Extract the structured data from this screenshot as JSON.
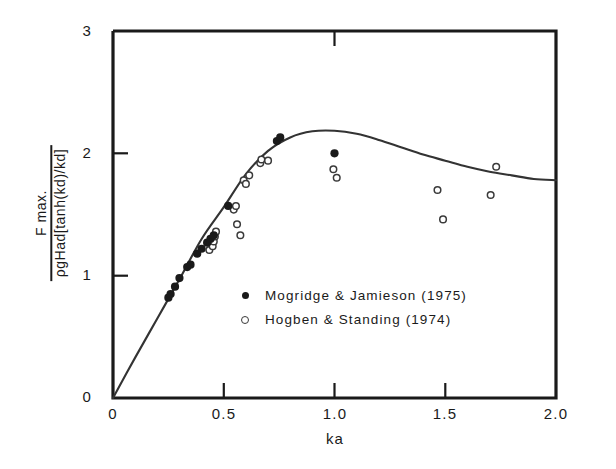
{
  "chart_data": {
    "type": "line",
    "title": "",
    "subtitle": "",
    "xlabel": "ka",
    "ylabel_numerator": "F max.",
    "ylabel_denominator": "ρgHad[tanh(kd)/kd]",
    "xlim": [
      0,
      2.0
    ],
    "ylim": [
      0,
      3
    ],
    "grid": false,
    "x_ticks": [
      0,
      0.5,
      1.0,
      1.5,
      2.0
    ],
    "x_tick_labels": [
      "0",
      "0.5",
      "1.0",
      "1.5",
      "2.0"
    ],
    "y_ticks": [
      0,
      1,
      2,
      3
    ],
    "y_tick_labels": [
      "0",
      "1",
      "2",
      "3"
    ],
    "legend_position": "inside-center",
    "series": [
      {
        "name": "theory-curve",
        "type": "line",
        "marker": "none",
        "color": "#333333",
        "x": [
          0.0,
          0.1,
          0.2,
          0.3,
          0.4,
          0.5,
          0.6,
          0.7,
          0.8,
          0.9,
          1.0,
          1.1,
          1.2,
          1.3,
          1.4,
          1.5,
          1.6,
          1.7,
          1.8,
          1.9,
          2.0
        ],
        "y": [
          0.0,
          0.33,
          0.65,
          0.97,
          1.3,
          1.56,
          1.83,
          2.02,
          2.13,
          2.18,
          2.185,
          2.16,
          2.11,
          2.05,
          1.99,
          1.94,
          1.89,
          1.85,
          1.82,
          1.79,
          1.78
        ]
      },
      {
        "name": "Mogridge & Jamieson (1975)",
        "type": "scatter",
        "marker": "filled-circle",
        "color": "#1a1a1a",
        "x": [
          0.25,
          0.26,
          0.28,
          0.3,
          0.335,
          0.35,
          0.38,
          0.4,
          0.425,
          0.44,
          0.455,
          0.52,
          0.74,
          0.755,
          1.0
        ],
        "y": [
          0.82,
          0.85,
          0.91,
          0.98,
          1.07,
          1.09,
          1.18,
          1.22,
          1.27,
          1.3,
          1.33,
          1.57,
          2.1,
          2.13,
          2.0
        ]
      },
      {
        "name": "Hogben & Standing (1974)",
        "type": "scatter",
        "marker": "open-circle",
        "color": "#3a3a3a",
        "x": [
          0.435,
          0.45,
          0.455,
          0.46,
          0.465,
          0.545,
          0.555,
          0.56,
          0.575,
          0.59,
          0.6,
          0.615,
          0.665,
          0.67,
          0.7,
          0.995,
          1.01,
          1.465,
          1.49,
          1.705,
          1.73
        ],
        "y": [
          1.21,
          1.24,
          1.28,
          1.32,
          1.36,
          1.54,
          1.57,
          1.42,
          1.33,
          1.78,
          1.75,
          1.82,
          1.92,
          1.95,
          1.94,
          1.87,
          1.8,
          1.7,
          1.46,
          1.66,
          1.89
        ]
      }
    ]
  },
  "axis": {
    "x_tick_labels": [
      "0",
      "0.5",
      "1.0",
      "1.5",
      "2.0"
    ],
    "y_tick_labels": [
      "0",
      "1",
      "2",
      "3"
    ],
    "xlabel": "ka"
  },
  "ylabel": {
    "numerator": "F max.",
    "denominator": "ρgHad[tanh(kd)/kd]"
  },
  "legend": {
    "entries": [
      {
        "marker": "filled-circle",
        "label": "Mogridge & Jamieson  (1975)"
      },
      {
        "marker": "open-circle",
        "label": "Hogben & Standing  (1974)"
      }
    ]
  },
  "colors": {
    "axis": "#1a1a1a",
    "curve": "#333333",
    "filled_marker": "#1a1a1a",
    "open_marker": "#3a3a3a",
    "background": "#ffffff"
  }
}
